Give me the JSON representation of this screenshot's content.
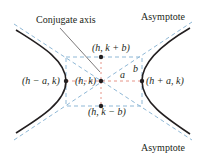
{
  "diagram": {
    "colors": {
      "curve": "#231f20",
      "asymptote": "#8fb8d6",
      "box": "#8fb8d6",
      "axis_dash": "#e07a6a",
      "text": "#231f20"
    },
    "labels": {
      "conjugate_axis": "Conjugate axis",
      "asymptote_top": "Asymptote",
      "asymptote_bottom": "Asymptote",
      "top_point": "(h, k + b)",
      "bottom_point": "(h, k − b)",
      "center": "(h, k)",
      "left_vertex": "(h − a, k)",
      "right_vertex": "(h + a, k)",
      "a": "a",
      "b": "b"
    },
    "points": {
      "center": [
        101,
        81
      ],
      "left_vertex": [
        66,
        81
      ],
      "right_vertex": [
        142,
        81
      ],
      "top_point": [
        101,
        57
      ],
      "bottom_point": [
        101,
        106
      ]
    }
  }
}
